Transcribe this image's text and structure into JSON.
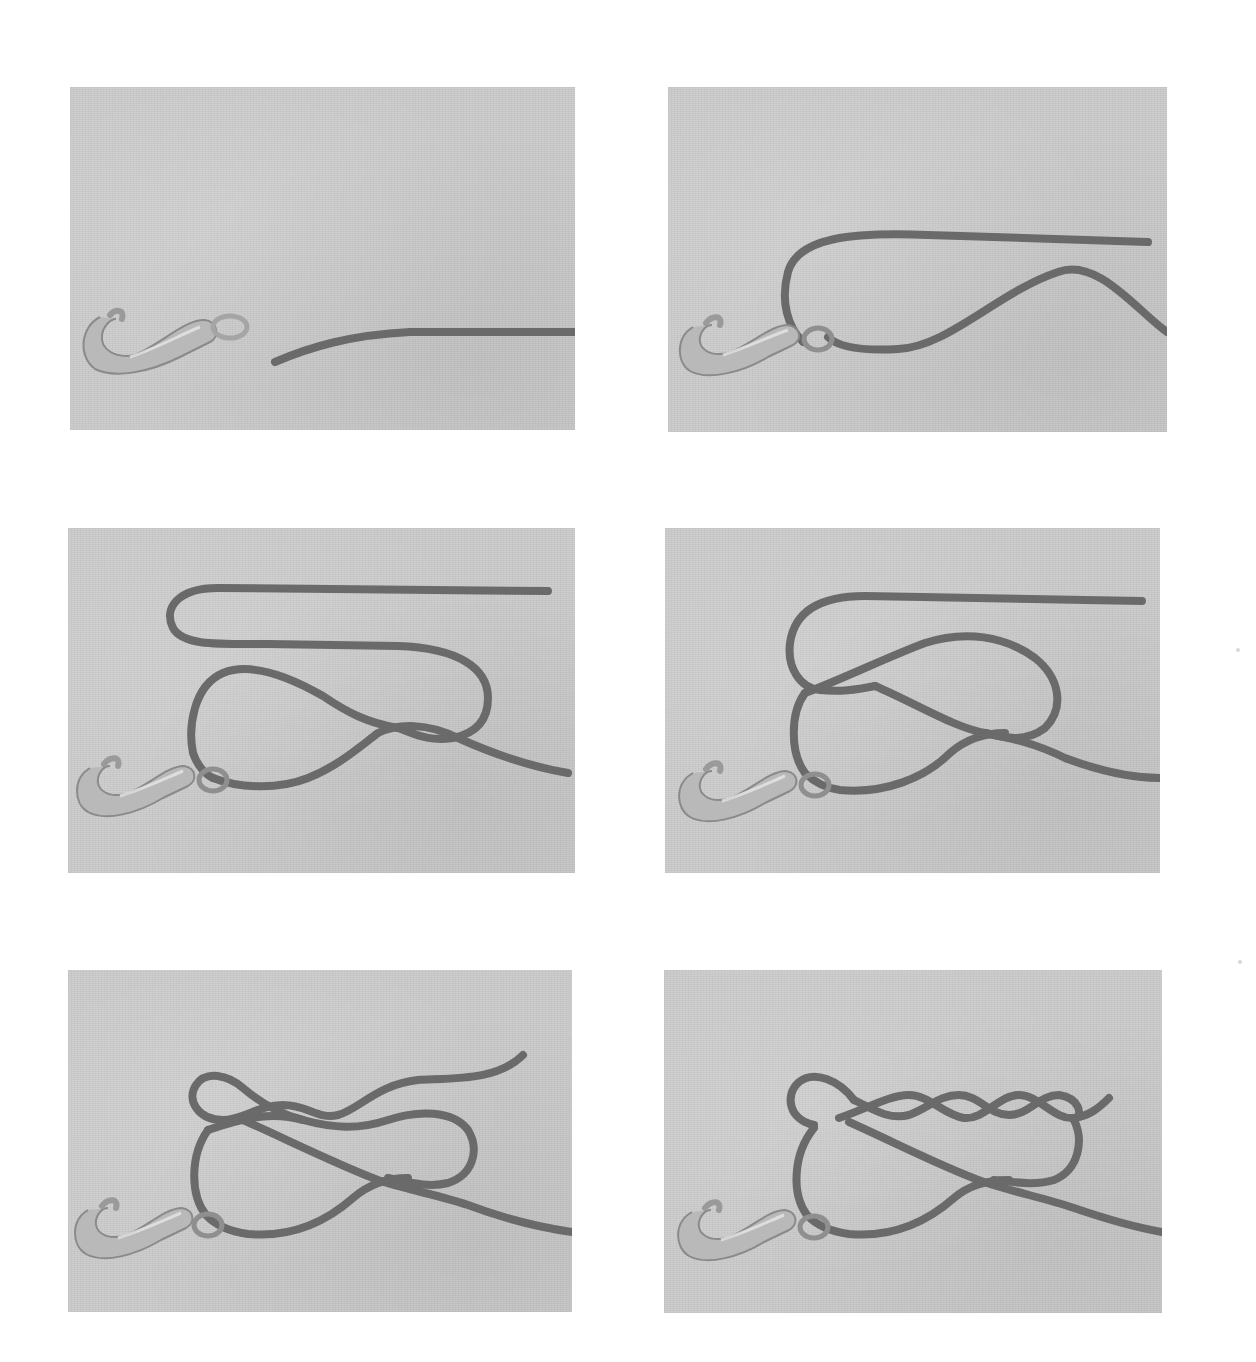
{
  "figure": {
    "layout": {
      "rows": 3,
      "columns": 2
    },
    "colors": {
      "page_background": "#ffffff",
      "photo_background": "#cbcbcb",
      "cord": "#6a6a6a",
      "hook_metal": "#b8b8b8"
    },
    "panels": [
      {
        "step": 1,
        "label": "Step 1: Cord end beside snap hook",
        "objects": [
          "snap-hook",
          "cord"
        ]
      },
      {
        "step": 2,
        "label": "Step 2: Cord passed through hook eye, forming a bight",
        "objects": [
          "snap-hook",
          "cord"
        ]
      },
      {
        "step": 3,
        "label": "Step 3: Cord looped back across standing part",
        "objects": [
          "snap-hook",
          "cord"
        ]
      },
      {
        "step": 4,
        "label": "Step 4: Second crossing formed",
        "objects": [
          "snap-hook",
          "cord"
        ]
      },
      {
        "step": 5,
        "label": "Step 5: Working end wrapped around the loop",
        "objects": [
          "snap-hook",
          "cord"
        ]
      },
      {
        "step": 6,
        "label": "Step 6: Multiple wraps completed",
        "objects": [
          "snap-hook",
          "cord"
        ]
      }
    ]
  }
}
